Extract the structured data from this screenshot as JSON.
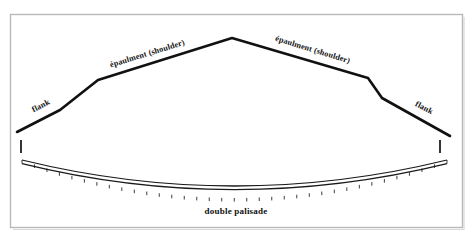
{
  "figure": {
    "background_color": "#ffffff",
    "frame_color": "#b9b9b9",
    "ink_color": "#111111"
  },
  "labels": {
    "shoulder_left": "épaulment (shoulder)",
    "shoulder_right": "épaulment (shoulder)",
    "flank_left": "flank",
    "flank_right": "flank",
    "palisade_caption": "double palisade"
  },
  "chart_data": {
    "type": "diagram",
    "elements": [
      {
        "name": "rampart-polyline",
        "description": "flank - shoulder - apex - shoulder - flank outline",
        "points": [
          [
            17,
            132
          ],
          [
            60,
            110
          ],
          [
            98,
            80
          ],
          [
            232,
            38
          ],
          [
            368,
            78
          ],
          [
            382,
            98
          ],
          [
            450,
            136
          ]
        ]
      },
      {
        "name": "gorge-tick-left",
        "description": "short vertical tick below left flank terminus",
        "points": [
          [
            21,
            140
          ],
          [
            21,
            153
          ]
        ]
      },
      {
        "name": "gorge-tick-right",
        "description": "short vertical tick below right flank terminus",
        "points": [
          [
            440,
            140
          ],
          [
            440,
            153
          ]
        ]
      },
      {
        "name": "double-palisade",
        "description": "downward curving double line with cross rungs",
        "left_end": [
          22,
          160
        ],
        "right_end": [
          447,
          160
        ],
        "lowest_point": [
          234,
          198
        ],
        "line_count": 2,
        "rung_count": 34
      }
    ],
    "annotations": [
      {
        "text": "épaulment (shoulder)",
        "x": 148,
        "y": 56,
        "rotation_deg": -17
      },
      {
        "text": "épaulment (shoulder)",
        "x": 312,
        "y": 52,
        "rotation_deg": 17
      },
      {
        "text": "flank",
        "x": 42,
        "y": 108,
        "rotation_deg": -27
      },
      {
        "text": "flank",
        "x": 423,
        "y": 110,
        "rotation_deg": 27
      },
      {
        "text": "double palisade",
        "x": 236,
        "y": 214,
        "rotation_deg": 0
      }
    ],
    "xlabel": "",
    "ylabel": "",
    "grid": false,
    "legend": "none"
  }
}
